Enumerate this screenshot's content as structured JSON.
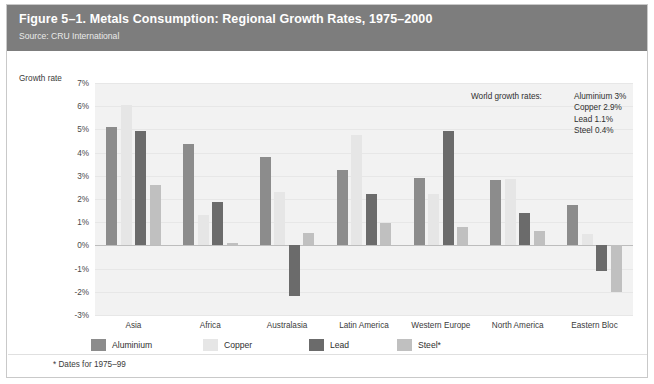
{
  "header": {
    "title": "Figure 5–1. Metals Consumption: Regional Growth Rates, 1975–2000",
    "source": "Source: CRU International"
  },
  "footnote": "* Dates for 1975–99",
  "annotation": {
    "label": "World growth rates:",
    "lines": [
      "Aluminium 3%",
      "Copper 2.9%",
      "Lead 1.1%",
      "Steel 0.4%"
    ]
  },
  "colors": {
    "header_bg": "#7d7d7d",
    "plot_bg": "#f2f2f2",
    "aluminium": "#8c8c8c",
    "copper": "#e6e6e6",
    "lead": "#6b6b6b",
    "steel": "#c0c0c0",
    "grid": "#e7e7e7",
    "zero": "#bdbdbd"
  },
  "chart_data": {
    "type": "bar",
    "title": "Figure 5–1. Metals Consumption: Regional Growth Rates, 1975–2000",
    "subtitle": "Source: CRU International",
    "xlabel": "",
    "ylabel": "Growth rate",
    "ylim": [
      -3,
      7
    ],
    "ytick_labels": [
      "7%",
      "6%",
      "5%",
      "4%",
      "3%",
      "2%",
      "1%",
      "0%",
      "-1%",
      "-2%",
      "-3%"
    ],
    "ytick_values": [
      7,
      6,
      5,
      4,
      3,
      2,
      1,
      0,
      -1,
      -2,
      -3
    ],
    "grid": true,
    "legend_position": "bottom",
    "categories": [
      "Asia",
      "Africa",
      "Australasia",
      "Latin America",
      "Western Europe",
      "North America",
      "Eastern Bloc"
    ],
    "series": [
      {
        "name": "Aluminium",
        "color": "#8c8c8c",
        "values": [
          5.1,
          4.35,
          3.8,
          3.25,
          2.9,
          2.8,
          1.75
        ]
      },
      {
        "name": "Copper",
        "color": "#e6e6e6",
        "values": [
          6.05,
          1.3,
          2.3,
          4.75,
          2.2,
          2.85,
          0.5
        ]
      },
      {
        "name": "Lead",
        "color": "#6b6b6b",
        "values": [
          4.95,
          1.85,
          -2.2,
          2.2,
          4.95,
          1.4,
          -1.1
        ]
      },
      {
        "name": "Steel*",
        "color": "#c0c0c0",
        "values": [
          2.6,
          0.1,
          0.55,
          0.95,
          0.8,
          0.6,
          -2.0
        ]
      }
    ],
    "annotations": [
      "World growth rates:",
      "Aluminium 3%",
      "Copper 2.9%",
      "Lead 1.1%",
      "Steel 0.4%"
    ],
    "footnote": "* Dates for 1975–99"
  }
}
